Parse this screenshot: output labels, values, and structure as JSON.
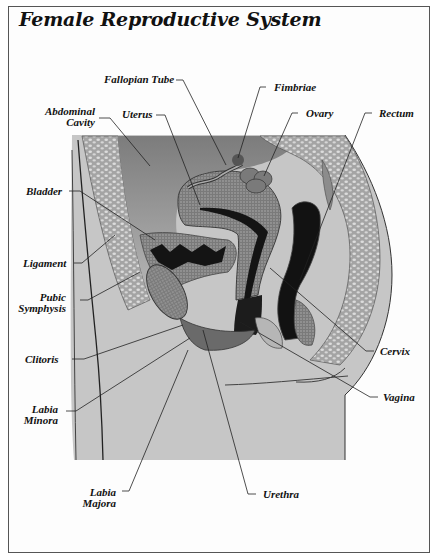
{
  "figure": {
    "title": "Female Reproductive System",
    "colors": {
      "background": "#ffffff",
      "frame_border": "#555555",
      "body_fill": "#c8c8c8",
      "cavity_fill": "#8a8a8a",
      "tissue_fill": "#a6a6a6",
      "dark_lumen": "#141414",
      "leader_line": "#222222"
    }
  },
  "labels": {
    "fallopian_tube": "Fallopian Tube",
    "fimbriae": "Fimbriae",
    "abdominal_cavity_1": "Abdominal",
    "abdominal_cavity_2": "Cavity",
    "uterus": "Uterus",
    "ovary": "Ovary",
    "rectum": "Rectum",
    "bladder": "Bladder",
    "ligament": "Ligament",
    "pubic_symphysis_1": "Pubic",
    "pubic_symphysis_2": "Symphysis",
    "clitoris": "Clitoris",
    "cervix": "Cervix",
    "vagina": "Vagina",
    "labia_minora_1": "Labia",
    "labia_minora_2": "Minora",
    "labia_majora_1": "Labia",
    "labia_majora_2": "Majora",
    "urethra": "Urethra"
  }
}
